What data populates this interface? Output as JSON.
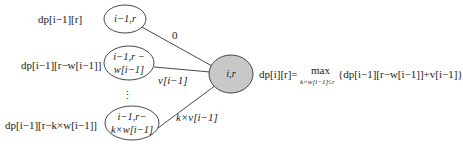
{
  "diagram": {
    "type": "state-transition",
    "colors": {
      "target_fill": "#c8c8c8",
      "stroke": "#333333",
      "background": "#ffffff"
    },
    "source_nodes": [
      {
        "id": "n1",
        "label_line1": "i−1,r",
        "label_line2": "",
        "dp_label": "dp[i−1][r]",
        "edge_label": "0"
      },
      {
        "id": "n2",
        "label_line1": "i−1,r −",
        "label_line2": "w[i−1]",
        "dp_label": "dp[i−1][r−w[i−1]]",
        "edge_label": "v[i−1]"
      },
      {
        "id": "n3",
        "label_line1": "i−1,r−",
        "label_line2": "k×w[i−1]",
        "dp_label": "dp[i−1][r−k×w[i−1]]",
        "edge_label": "k×v[i−1]"
      }
    ],
    "ellipsis": "⋮",
    "target_node": {
      "label": "i,r"
    },
    "formula": {
      "lhs": "dp[i][r]=",
      "op": "max",
      "subscript": "k×w[i−1]≤r",
      "rhs": "{dp[i−1][r−w[i−1]]+v[i−1]}"
    }
  }
}
